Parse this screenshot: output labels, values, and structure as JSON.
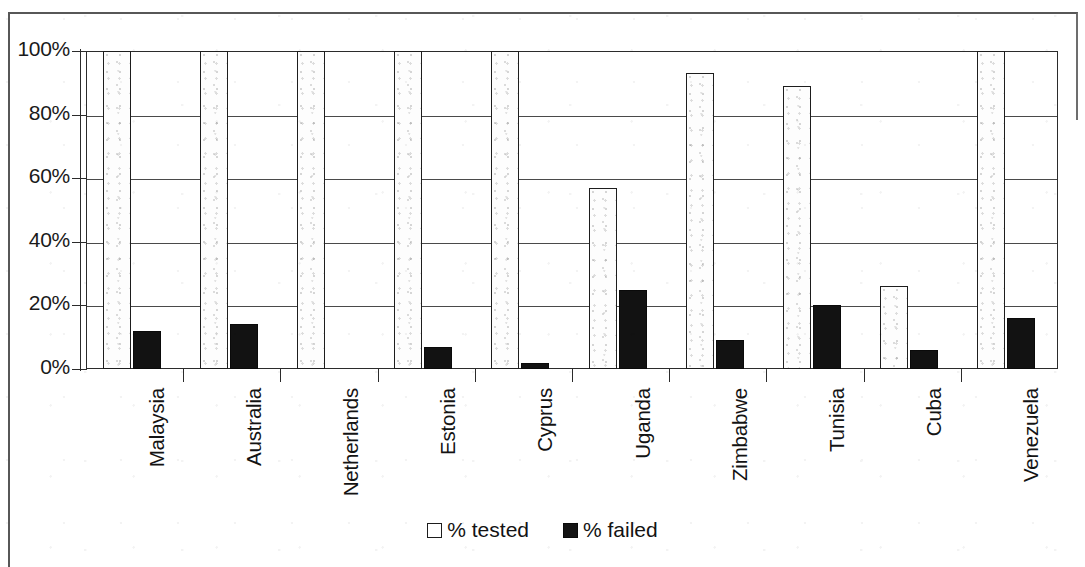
{
  "chart_data": {
    "type": "bar",
    "title": "",
    "subtitle": "",
    "xlabel": "",
    "ylabel": "",
    "ylim": [
      0,
      100
    ],
    "ytick_labels": [
      "0%",
      "20%",
      "40%",
      "60%",
      "80%",
      "100%"
    ],
    "ytick_values": [
      0,
      20,
      40,
      60,
      80,
      100
    ],
    "grid": true,
    "legend_position": "bottom",
    "categories": [
      "Malaysia",
      "Australia",
      "Netherlands",
      "Estonia",
      "Cyprus",
      "Uganda",
      "Zimbabwe",
      "Tunisia",
      "Cuba",
      "Venezuela"
    ],
    "series": [
      {
        "name": "% tested",
        "values": [
          100,
          100,
          100,
          100,
          100,
          57,
          93,
          89,
          26,
          100
        ]
      },
      {
        "name": "% failed",
        "values": [
          12,
          14,
          0,
          7,
          2,
          25,
          9,
          20,
          6,
          16
        ]
      }
    ]
  },
  "legend": {
    "items": [
      {
        "label": "% tested",
        "swatch": "hollow-square",
        "color": "#ffffff"
      },
      {
        "label": "% failed",
        "swatch": "filled-square",
        "color": "#141414"
      }
    ]
  },
  "colors": {
    "tested_fill": "#fdfdfd",
    "tested_outline": "#1d1d1d",
    "failed_fill": "#121212",
    "axis": "#2b2b2b",
    "grid": "#4a4a4a",
    "background": "#ffffff"
  }
}
